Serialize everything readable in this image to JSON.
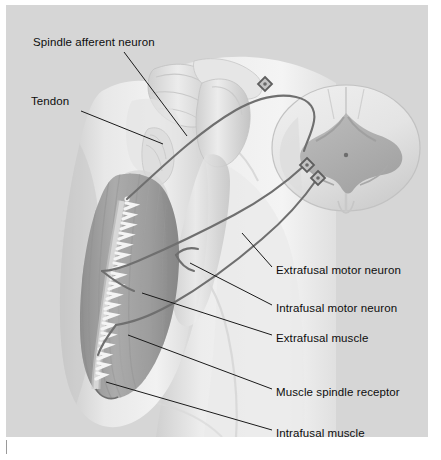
{
  "figure": {
    "style": "grayscale medical illustration",
    "plate": {
      "x": 6,
      "y": 5,
      "width": 422,
      "height": 432
    },
    "colors": {
      "plate_background": "#d6d6d6",
      "page_background": "#ffffff",
      "skin_light": "#ededed",
      "skin_shadow": "#c3c3c3",
      "muscle": "#a9a9a9",
      "muscle_dark": "#959595",
      "bone": "#e2e2e2",
      "bone_shadow": "#bdbdbd",
      "cord_white_matter": "#e6e6e6",
      "cord_gray_matter": "#b0b0b0",
      "nerve": "#6f6f6f",
      "spindle": "#f2f2f2",
      "leader_line": "#1a1a1a",
      "label_text": "#0d0d0d"
    }
  },
  "labels": [
    {
      "id": "spindle-afferent-neuron",
      "text": "Spindle afferent neuron",
      "text_x": 27,
      "text_y": 31,
      "anchor": "left",
      "leader": {
        "x1": 118,
        "y1": 47,
        "x2": 181,
        "y2": 131
      }
    },
    {
      "id": "tendon",
      "text": "Tendon",
      "text_x": 25,
      "text_y": 90,
      "anchor": "left",
      "leader": {
        "x1": 75,
        "y1": 106,
        "x2": 157,
        "y2": 139
      }
    },
    {
      "id": "extrafusal-motor-neuron",
      "text": "Extrafusal motor neuron",
      "text_x": 270,
      "text_y": 259,
      "anchor": "right",
      "leader": {
        "x1": 266,
        "y1": 262,
        "x2": 236,
        "y2": 228
      }
    },
    {
      "id": "intrafusal-motor-neuron",
      "text": "Intrafusal motor neuron",
      "text_x": 270,
      "text_y": 297,
      "anchor": "right",
      "leader": {
        "x1": 266,
        "y1": 300,
        "x2": 184,
        "y2": 258
      }
    },
    {
      "id": "extrafusal-muscle",
      "text": "Extrafusal muscle",
      "text_x": 270,
      "text_y": 327,
      "anchor": "right",
      "leader": {
        "x1": 266,
        "y1": 330,
        "x2": 136,
        "y2": 288
      }
    },
    {
      "id": "muscle-spindle-receptor",
      "text": "Muscle spindle receptor",
      "text_x": 270,
      "text_y": 381,
      "anchor": "right",
      "leader": {
        "x1": 266,
        "y1": 384,
        "x2": 122,
        "y2": 330
      }
    },
    {
      "id": "intrafusal-muscle",
      "text": "Intrafusal muscle",
      "text_x": 270,
      "text_y": 422,
      "anchor": "right",
      "leader": {
        "x1": 266,
        "y1": 425,
        "x2": 100,
        "y2": 377
      }
    }
  ],
  "anatomy": {
    "parts": [
      "arm-skin-silhouette",
      "torso-silhouette",
      "scapula-bone",
      "clavicle-bone",
      "humerus-head-bone",
      "humerus-shaft-bone",
      "biceps-muscle",
      "tendon-band",
      "muscle-spindle",
      "spinal-cord-cross-section"
    ],
    "spinal_cord": {
      "features": [
        "gray-matter-butterfly",
        "white-matter",
        "central-canal",
        "dorsal-horn",
        "ventral-horn",
        "dorsal-median-sulcus",
        "ventral-median-fissure"
      ]
    },
    "neurons": [
      {
        "id": "afferent-neuron",
        "cell_body": {
          "x": 259,
          "y": 79
        },
        "shape": "diamond",
        "path": "muscle-spindle to dorsal-root"
      },
      {
        "id": "extrafusal-motor-neuron-body",
        "cell_body": {
          "x": 301,
          "y": 160
        },
        "shape": "diamond",
        "path": "ventral-horn to extrafusal-muscle"
      },
      {
        "id": "intrafusal-motor-neuron-body",
        "cell_body": {
          "x": 312,
          "y": 173
        },
        "shape": "diamond",
        "path": "ventral-horn to intrafusal-muscle"
      }
    ]
  }
}
